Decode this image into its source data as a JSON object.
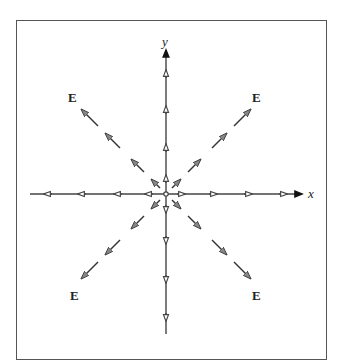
{
  "diagram": {
    "title": "",
    "axes": {
      "x_label": "x",
      "y_label": "y"
    },
    "field_labels": [
      {
        "position": "top-left",
        "text": "E"
      },
      {
        "position": "top-right",
        "text": "E"
      },
      {
        "position": "bottom-left",
        "text": "E"
      },
      {
        "position": "bottom-right",
        "text": "E"
      }
    ],
    "field_directions_count": 8,
    "colors": {
      "line": "#444444",
      "axis_arrow": "#111111",
      "frame": "#555555",
      "background": "#ffffff"
    }
  }
}
